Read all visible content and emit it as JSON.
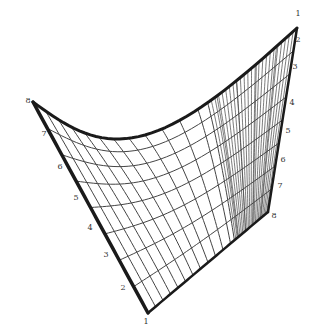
{
  "colors": {
    "ink": "#1a1a1a",
    "grid": "#444444",
    "background": "#ffffff"
  },
  "vertices": {
    "top_left": [
      33,
      102
    ],
    "bottom": [
      148,
      313
    ],
    "top_right": [
      297,
      28
    ],
    "right_bottom": [
      268,
      212
    ]
  },
  "divisions": 8,
  "left_edge_labels": [
    {
      "text": "8",
      "x": 28,
      "y": 101
    },
    {
      "text": "7",
      "x": 44,
      "y": 134
    },
    {
      "text": "6",
      "x": 60,
      "y": 167
    },
    {
      "text": "5",
      "x": 76,
      "y": 198
    },
    {
      "text": "4",
      "x": 90,
      "y": 228
    },
    {
      "text": "3",
      "x": 106,
      "y": 255
    },
    {
      "text": "2",
      "x": 123,
      "y": 288
    },
    {
      "text": "1",
      "x": 146,
      "y": 322
    }
  ],
  "right_edge_labels": [
    {
      "text": "1",
      "x": 298,
      "y": 14
    },
    {
      "text": "2",
      "x": 298,
      "y": 40
    },
    {
      "text": "3",
      "x": 295,
      "y": 67
    },
    {
      "text": "4",
      "x": 292,
      "y": 103
    },
    {
      "text": "5",
      "x": 288,
      "y": 131
    },
    {
      "text": "6",
      "x": 283,
      "y": 160
    },
    {
      "text": "7",
      "x": 280,
      "y": 186
    },
    {
      "text": "8",
      "x": 274,
      "y": 216
    }
  ]
}
